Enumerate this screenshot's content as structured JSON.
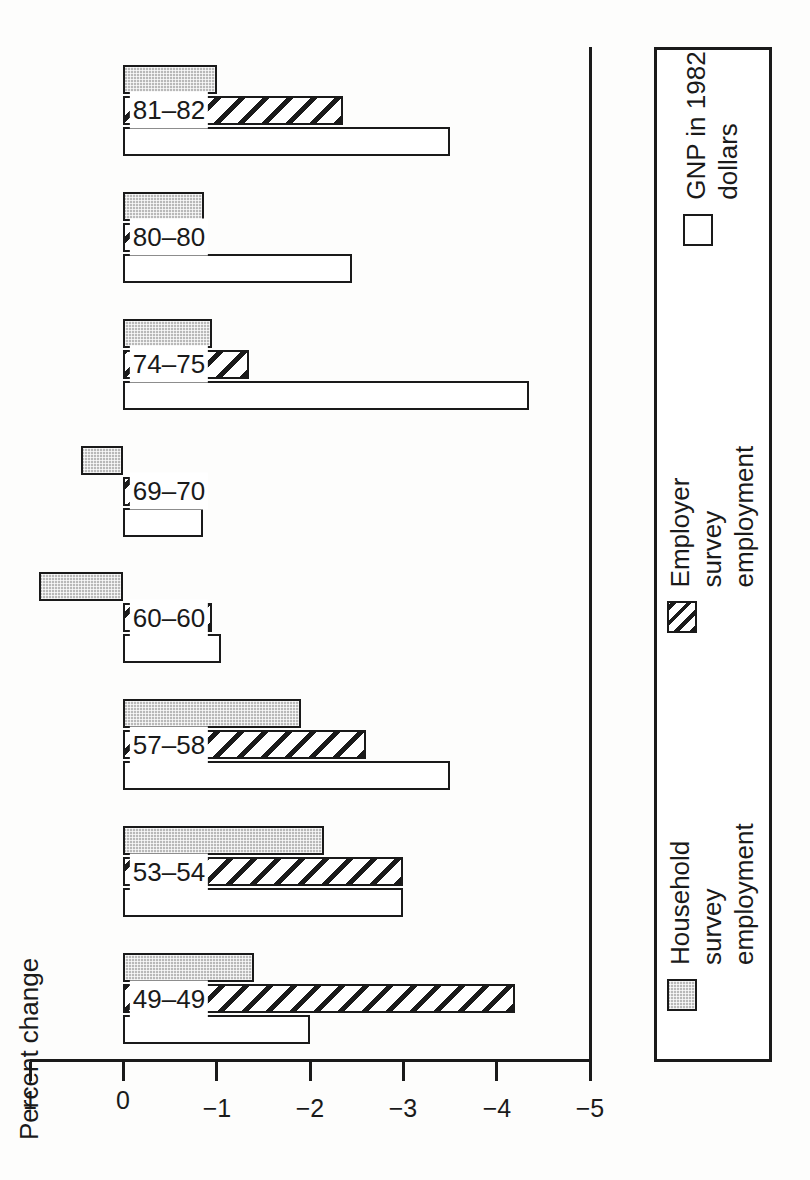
{
  "chart_data": {
    "type": "bar",
    "title": "",
    "orientation": "horizontal-rotated",
    "xlabel": "",
    "ylabel": "Percent change",
    "axis_title": "Percent change",
    "categories": [
      "49–49",
      "53–54",
      "57–58",
      "60–60",
      "69–70",
      "74–75",
      "80–80",
      "81–82"
    ],
    "ylim": [
      1,
      -5
    ],
    "tick_values": [
      1,
      0,
      -1,
      -2,
      -3,
      -4,
      -5
    ],
    "tick_labels": [
      "1",
      "0",
      "−1",
      "−2",
      "−3",
      "−4",
      "−5"
    ],
    "grid": false,
    "legend_position": "bottom",
    "series": [
      {
        "name": "Household survey employment",
        "legend_label": "Household survey\nemployment",
        "pattern": "dotted",
        "values": [
          -1.4,
          -2.15,
          -1.9,
          0.9,
          0.45,
          -0.95,
          -0.86,
          -1.0
        ]
      },
      {
        "name": "Employer survey employment",
        "legend_label": "Employer survey\nemployment",
        "pattern": "hatched",
        "values": [
          -4.2,
          -3.0,
          -2.6,
          -0.95,
          -0.4,
          -1.35,
          -0.75,
          -2.35
        ]
      },
      {
        "name": "GNP in 1982 dollars",
        "legend_label": "GNP in 1982 dollars",
        "pattern": "open",
        "values": [
          -2.0,
          -3.0,
          -3.5,
          -1.05,
          -0.85,
          -4.35,
          -2.45,
          -3.5
        ]
      }
    ]
  },
  "legend": {
    "items": [
      {
        "label": "Household survey\nemployment",
        "pattern": "dotted"
      },
      {
        "label": "Employer survey\nemployment",
        "pattern": "hatched"
      },
      {
        "label": "GNP in 1982 dollars",
        "pattern": "open"
      }
    ]
  },
  "axis": {
    "title": "Percent change"
  }
}
